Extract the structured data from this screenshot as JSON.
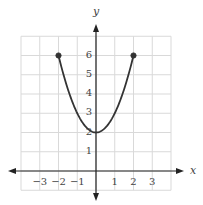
{
  "chart_data": {
    "type": "line",
    "title": "",
    "xlabel": "x",
    "ylabel": "y",
    "xlim": [
      -4,
      4
    ],
    "ylim": [
      -1,
      7
    ],
    "grid": true,
    "x_ticks": [
      -3,
      -2,
      -1,
      1,
      2,
      3
    ],
    "x_tick_labels": [
      "−3",
      "−2",
      "−1",
      "1",
      "2",
      "3"
    ],
    "y_ticks": [
      1,
      2,
      3,
      4,
      5,
      6
    ],
    "y_tick_labels": [
      "1",
      "2",
      "3",
      "4",
      "5",
      "6"
    ],
    "series": [
      {
        "name": "y = x^2 + 2",
        "domain": [
          -2,
          2
        ],
        "x": [
          -2,
          -1.5,
          -1,
          -0.5,
          0,
          0.5,
          1,
          1.5,
          2
        ],
        "y": [
          6,
          4.25,
          3,
          2.25,
          2,
          2.25,
          3,
          4.25,
          6
        ],
        "endpoints": [
          {
            "x": -2,
            "y": 6,
            "closed": true
          },
          {
            "x": 2,
            "y": 6,
            "closed": true
          }
        ]
      }
    ],
    "legend": null
  },
  "colors": {
    "grid": "#d9d9d9",
    "axis": "#222222",
    "curve": "#333333",
    "text": "#444444"
  },
  "labels": {
    "x_axis": "x",
    "y_axis": "y"
  }
}
